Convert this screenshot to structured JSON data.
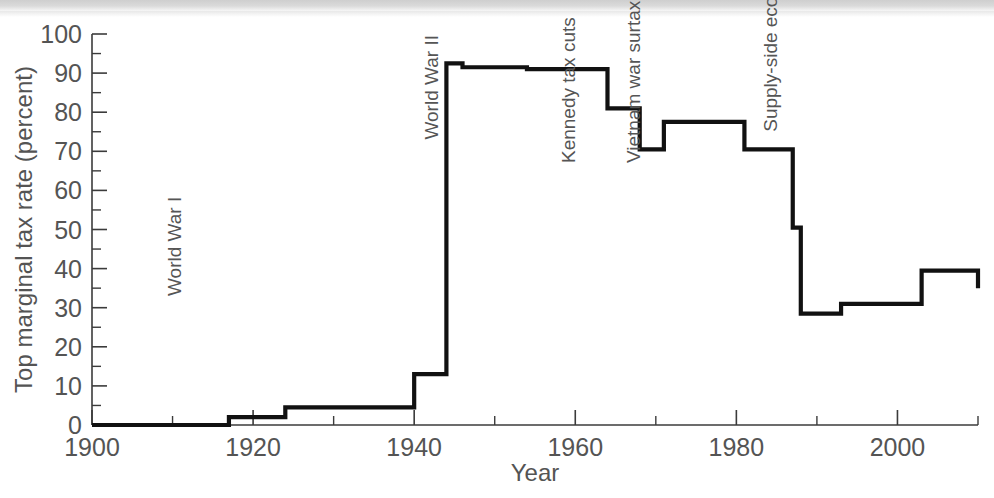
{
  "chart_data": {
    "type": "line",
    "title": "",
    "xlabel": "Year",
    "ylabel": "Top marginal tax rate (percent)",
    "xlim": [
      1900,
      2010
    ],
    "ylim": [
      0,
      100
    ],
    "grid": false,
    "legend": "none",
    "step_style": "post",
    "x_ticks_major": [
      1900,
      1910,
      1920,
      1930,
      1940,
      1950,
      1960,
      1970,
      1980,
      1990,
      2000,
      2010
    ],
    "x_tick_labels": [
      "1900",
      "",
      "1920",
      "",
      "1940",
      "",
      "1960",
      "",
      "1980",
      "",
      "2000",
      ""
    ],
    "y_ticks_major": [
      0,
      10,
      20,
      30,
      40,
      50,
      60,
      70,
      80,
      90,
      100
    ],
    "y_tick_labels": [
      "0",
      "10",
      "20",
      "30",
      "40",
      "50",
      "60",
      "70",
      "80",
      "90",
      "100"
    ],
    "y_ticks_minor": [
      5,
      15,
      25,
      35,
      45,
      55,
      65,
      75,
      85,
      95
    ],
    "x": [
      1900,
      1916,
      1917,
      1918,
      1922,
      1924,
      1925,
      1932,
      1936,
      1940,
      1942,
      1944,
      1946,
      1948,
      1950,
      1952,
      1954,
      1964,
      1965,
      1968,
      1971,
      1981,
      1987,
      1988,
      1991,
      1993,
      2003,
      2010
    ],
    "values": [
      0,
      0,
      2.0,
      2.0,
      2.0,
      4.5,
      4.5,
      4.5,
      4.5,
      13.0,
      13.0,
      92.5,
      91.5,
      91.5,
      91.5,
      91.5,
      91.0,
      81.0,
      81.0,
      70.5,
      77.5,
      70.5,
      50.5,
      28.5,
      28.5,
      31.0,
      39.5,
      35.0
    ],
    "series_name": "Top marginal tax rate",
    "annotations": [
      {
        "text": "World War I",
        "x": 1911,
        "y": 33
      },
      {
        "text": "World War II",
        "x": 1943,
        "y": 73
      },
      {
        "text": "Kennedy tax cuts",
        "x": 1960,
        "y": 67
      },
      {
        "text": "Vietnam war surtax",
        "x": 1968,
        "y": 67
      },
      {
        "text": "Supply-side economics",
        "x": 1985,
        "y": 75
      }
    ]
  },
  "colors": {
    "line": "#111111",
    "axis": "#3b3b3b",
    "text": "#545454",
    "background": "#ffffff"
  }
}
